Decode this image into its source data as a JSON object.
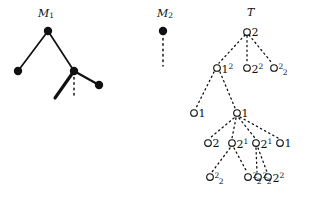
{
  "figure": {
    "width": 309,
    "height": 202,
    "background": "#ffffff",
    "ink": "#101010"
  },
  "panels": [
    {
      "id": "M1",
      "label": "M",
      "label_sub": "1",
      "label_x": 38,
      "label_y": 8,
      "node_style": "filled",
      "nodes": [
        {
          "name": "m1-root",
          "x": 48,
          "y": 31,
          "r": 4.2
        },
        {
          "name": "m1-leaf-left",
          "x": 18,
          "y": 71,
          "r": 4.2
        },
        {
          "name": "m1-inner-right",
          "x": 74,
          "y": 71,
          "r": 4.2
        },
        {
          "name": "m1-leaf-right",
          "x": 99,
          "y": 85,
          "r": 4.2
        }
      ],
      "edges": [
        {
          "name": "m1-edge-root-left",
          "x1": 48,
          "y1": 31,
          "x2": 18,
          "y2": 71,
          "style": "solid",
          "width": 1.7
        },
        {
          "name": "m1-edge-root-right",
          "x1": 48,
          "y1": 31,
          "x2": 74,
          "y2": 71,
          "style": "solid",
          "width": 1.7
        },
        {
          "name": "m1-edge-thick-down",
          "x1": 74,
          "y1": 71,
          "x2": 55,
          "y2": 98,
          "style": "solid",
          "width": 3.1
        },
        {
          "name": "m1-edge-dotted-down",
          "x1": 74,
          "y1": 72,
          "x2": 74,
          "y2": 97,
          "style": "dotted",
          "width": 1.5
        },
        {
          "name": "m1-edge-right-leaf",
          "x1": 74,
          "y1": 71,
          "x2": 99,
          "y2": 85,
          "style": "solid",
          "width": 2.2
        }
      ]
    },
    {
      "id": "M2",
      "label": "M",
      "label_sub": "2",
      "label_x": 157,
      "label_y": 8,
      "node_style": "filled",
      "nodes": [
        {
          "name": "m2-root",
          "x": 163,
          "y": 31,
          "r": 4.2
        }
      ],
      "edges": [
        {
          "name": "m2-edge-dotted-down",
          "x1": 163,
          "y1": 33,
          "x2": 163,
          "y2": 66,
          "style": "dotted",
          "width": 1.5
        }
      ]
    },
    {
      "id": "T",
      "label": "T",
      "label_sub": "",
      "label_x": 247,
      "label_y": 7,
      "node_style": "open",
      "nodes": [
        {
          "name": "t-node-root",
          "x": 247,
          "y": 32,
          "r": 3.3,
          "text": "2",
          "sup": "",
          "sub": ""
        },
        {
          "name": "t-node-l1a",
          "x": 217,
          "y": 68,
          "r": 3.3,
          "text": "1",
          "sup": "2",
          "sub": ""
        },
        {
          "name": "t-node-l1b",
          "x": 247,
          "y": 68,
          "r": 3.3,
          "text": "2",
          "sup": "2",
          "sub": ""
        },
        {
          "name": "t-node-l1c",
          "x": 274,
          "y": 68,
          "r": 3.3,
          "text": "",
          "sup": "2",
          "sub": "2"
        },
        {
          "name": "t-node-l2a",
          "x": 194,
          "y": 113,
          "r": 3.3,
          "text": "1",
          "sup": "",
          "sub": ""
        },
        {
          "name": "t-node-l2b",
          "x": 237,
          "y": 113,
          "r": 3.3,
          "text": "1",
          "sup": "",
          "sub": ""
        },
        {
          "name": "t-node-l3a",
          "x": 208,
          "y": 143,
          "r": 3.3,
          "text": "2",
          "sup": "",
          "sub": ""
        },
        {
          "name": "t-node-l3b",
          "x": 232,
          "y": 143,
          "r": 3.3,
          "text": "2",
          "sup": "1",
          "sub": ""
        },
        {
          "name": "t-node-l3c",
          "x": 256,
          "y": 143,
          "r": 3.3,
          "text": "2",
          "sup": "1",
          "sub": ""
        },
        {
          "name": "t-node-l3d",
          "x": 280,
          "y": 143,
          "r": 3.3,
          "text": "1",
          "sup": "",
          "sub": ""
        },
        {
          "name": "t-node-l4a",
          "x": 210,
          "y": 177,
          "r": 3.3,
          "text": "",
          "sup": "2",
          "sub": "2"
        },
        {
          "name": "t-node-l4b",
          "x": 248,
          "y": 177,
          "r": 3.3,
          "text": "",
          "sup": "2",
          "sub": "2"
        },
        {
          "name": "t-node-l4c",
          "x": 258,
          "y": 177,
          "r": 3.3,
          "text": "",
          "sup": "2",
          "sub": "2"
        },
        {
          "name": "t-node-l4d",
          "x": 268,
          "y": 177,
          "r": 3.3,
          "text": "2",
          "sup": "2",
          "sub": ""
        }
      ],
      "edges": [
        {
          "name": "t-edge-root-l1a",
          "x1": 245,
          "y1": 35,
          "x2": 219,
          "y2": 63,
          "style": "dotted",
          "width": 1.3
        },
        {
          "name": "t-edge-root-l1b",
          "x1": 247,
          "y1": 36,
          "x2": 247,
          "y2": 63,
          "style": "dotted",
          "width": 1.3
        },
        {
          "name": "t-edge-root-l1c",
          "x1": 249,
          "y1": 35,
          "x2": 272,
          "y2": 63,
          "style": "dotted",
          "width": 1.3
        },
        {
          "name": "t-edge-l1a-l2a",
          "x1": 214,
          "y1": 72,
          "x2": 196,
          "y2": 108,
          "style": "dotted",
          "width": 1.3
        },
        {
          "name": "t-edge-l1a-l2b",
          "x1": 220,
          "y1": 72,
          "x2": 235,
          "y2": 108,
          "style": "dotted",
          "width": 1.3
        },
        {
          "name": "t-edge-l2b-l3a",
          "x1": 234,
          "y1": 118,
          "x2": 210,
          "y2": 138,
          "style": "dotted",
          "width": 1.3
        },
        {
          "name": "t-edge-l2b-l3b",
          "x1": 236,
          "y1": 118,
          "x2": 232,
          "y2": 138,
          "style": "dotted",
          "width": 1.3
        },
        {
          "name": "t-edge-l2b-l3c",
          "x1": 239,
          "y1": 118,
          "x2": 255,
          "y2": 138,
          "style": "dotted",
          "width": 1.3
        },
        {
          "name": "t-edge-l2b-l3d",
          "x1": 240,
          "y1": 117,
          "x2": 278,
          "y2": 138,
          "style": "dotted",
          "width": 1.3
        },
        {
          "name": "t-edge-l3b-l4a",
          "x1": 230,
          "y1": 148,
          "x2": 212,
          "y2": 172,
          "style": "dotted",
          "width": 1.3
        },
        {
          "name": "t-edge-l3b-l4b",
          "x1": 234,
          "y1": 148,
          "x2": 247,
          "y2": 172,
          "style": "dotted",
          "width": 1.3
        },
        {
          "name": "t-edge-l3c-l4c",
          "x1": 256,
          "y1": 148,
          "x2": 257,
          "y2": 172,
          "style": "dotted",
          "width": 1.3
        },
        {
          "name": "t-edge-l3c-l4d",
          "x1": 258,
          "y1": 148,
          "x2": 267,
          "y2": 172,
          "style": "dotted",
          "width": 1.3
        }
      ]
    }
  ]
}
